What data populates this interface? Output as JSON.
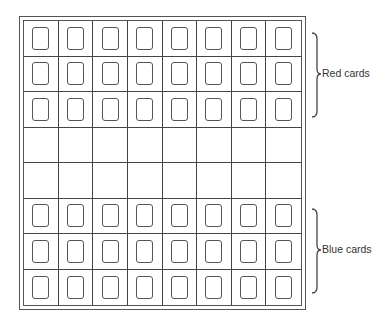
{
  "diagram": {
    "grid": {
      "columns": 8,
      "rows": 8
    },
    "rows": [
      {
        "group": "red",
        "has_cards": true
      },
      {
        "group": "red",
        "has_cards": true
      },
      {
        "group": "red",
        "has_cards": true
      },
      {
        "group": "empty",
        "has_cards": false
      },
      {
        "group": "empty",
        "has_cards": false
      },
      {
        "group": "blue",
        "has_cards": true
      },
      {
        "group": "blue",
        "has_cards": true
      },
      {
        "group": "blue",
        "has_cards": true
      }
    ],
    "labels": {
      "red": "Red cards",
      "blue": "Blue cards"
    }
  }
}
